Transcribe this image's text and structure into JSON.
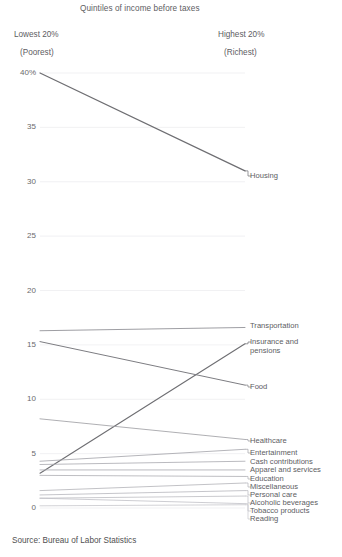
{
  "chart_data": {
    "type": "line",
    "title": "Quintiles of income before taxes",
    "subtitle": "",
    "xlabel": "",
    "ylabel": "",
    "x": [
      "Lowest 20%",
      "Highest 20%"
    ],
    "x_headers": [
      {
        "line1": "Lowest 20%",
        "line2": "(Poorest)"
      },
      {
        "line1": "Highest 20%",
        "line2": "(Richest)"
      }
    ],
    "ylim": [
      0,
      40
    ],
    "yticks": [
      0,
      5,
      10,
      15,
      20,
      25,
      30,
      35,
      40
    ],
    "ytick_labels": [
      "0",
      "5",
      "10",
      "15",
      "20",
      "25",
      "30",
      "35",
      "40%"
    ],
    "grid": true,
    "legend_position": "right-inline",
    "source": "Source: Bureau of Labor Statistics",
    "footnote": "",
    "series": [
      {
        "name": "Housing",
        "values": [
          40.0,
          31.0
        ],
        "color": "#6e6e72",
        "width": 1.25,
        "label_wrap": false
      },
      {
        "name": "Transportation",
        "values": [
          16.3,
          16.6
        ],
        "color": "#8d8d92",
        "width": 0.85,
        "label_wrap": false
      },
      {
        "name": "Insurance and pensions",
        "values": [
          3.2,
          15.1
        ],
        "color": "#6e6e72",
        "width": 1.1,
        "label_wrap": true
      },
      {
        "name": "Food",
        "values": [
          15.3,
          11.3
        ],
        "color": "#7d7d82",
        "width": 1.0,
        "label_wrap": false
      },
      {
        "name": "Healthcare",
        "values": [
          8.2,
          6.3
        ],
        "color": "#9a9aa0",
        "width": 0.8,
        "label_wrap": false
      },
      {
        "name": "Entertainment",
        "values": [
          4.3,
          5.4
        ],
        "color": "#a2a2a8",
        "width": 0.8,
        "label_wrap": false
      },
      {
        "name": "Cash contributions",
        "values": [
          4.0,
          4.3
        ],
        "color": "#a8a8ae",
        "width": 0.8,
        "label_wrap": false
      },
      {
        "name": "Apparel and services",
        "values": [
          3.5,
          3.5
        ],
        "color": "#a8a8ae",
        "width": 0.8,
        "label_wrap": false
      },
      {
        "name": "Education",
        "values": [
          3.0,
          2.9
        ],
        "color": "#adadb3",
        "width": 0.8,
        "label_wrap": false
      },
      {
        "name": "Miscellaneous",
        "values": [
          1.6,
          2.3
        ],
        "color": "#b2b2b8",
        "width": 0.8,
        "label_wrap": false
      },
      {
        "name": "Personal care",
        "values": [
          1.2,
          1.6
        ],
        "color": "#b6b6bc",
        "width": 0.8,
        "label_wrap": false
      },
      {
        "name": "Alcoholic beverages",
        "values": [
          0.9,
          1.1
        ],
        "color": "#bcbcc2",
        "width": 0.8,
        "label_wrap": false
      },
      {
        "name": "Tobacco products",
        "values": [
          0.9,
          0.4
        ],
        "color": "#c0c0c6",
        "width": 0.8,
        "label_wrap": false
      },
      {
        "name": "Reading",
        "values": [
          0.2,
          0.3
        ],
        "color": "#c6c6cc",
        "width": 0.8,
        "label_wrap": false
      }
    ]
  },
  "geometry": {
    "x_left_px": 40,
    "x_right_px": 245,
    "y_top_px": 73,
    "y_bottom_px": 508,
    "grid_color": "#ededf0",
    "label_x_px": 250
  },
  "label_positions": [
    {
      "name": "Housing",
      "top": 172
    },
    {
      "name": "Transportation",
      "top": 322
    },
    {
      "name": "Insurance and pensions",
      "top": 338
    },
    {
      "name": "Food",
      "top": 383
    },
    {
      "name": "Healthcare",
      "top": 437
    },
    {
      "name": "Entertainment",
      "top": 449
    },
    {
      "name": "Cash contributions",
      "top": 458
    },
    {
      "name": "Apparel and services",
      "top": 466
    },
    {
      "name": "Education",
      "top": 475
    },
    {
      "name": "Miscellaneous",
      "top": 483
    },
    {
      "name": "Personal care",
      "top": 491
    },
    {
      "name": "Alcoholic beverages",
      "top": 499
    },
    {
      "name": "Tobacco products",
      "top": 507
    },
    {
      "name": "Reading",
      "top": 515
    }
  ]
}
